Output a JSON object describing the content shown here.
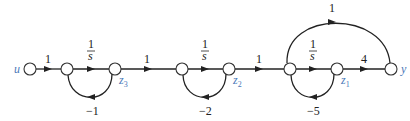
{
  "diagram": {
    "type": "signal-flow-graph",
    "nodes": [
      {
        "id": "u",
        "label": "u",
        "x": 30
      },
      {
        "id": "n1",
        "label": "",
        "x": 67
      },
      {
        "id": "z3",
        "label": "z",
        "sub": "3",
        "x": 115
      },
      {
        "id": "n2",
        "label": "",
        "x": 182
      },
      {
        "id": "z2",
        "label": "z",
        "sub": "2",
        "x": 229
      },
      {
        "id": "n3",
        "label": "",
        "x": 290
      },
      {
        "id": "z1",
        "label": "z",
        "sub": "1",
        "x": 337
      },
      {
        "id": "y",
        "label": "y",
        "x": 391
      }
    ],
    "edges": [
      {
        "from": "u",
        "to": "n1",
        "gain": "1"
      },
      {
        "from": "n1",
        "to": "z3",
        "gain_num": "1",
        "gain_den": "s"
      },
      {
        "from": "z3",
        "to": "n1",
        "gain": "−1",
        "feedback": true
      },
      {
        "from": "z3",
        "to": "n2",
        "gain": "1"
      },
      {
        "from": "n2",
        "to": "z2",
        "gain_num": "1",
        "gain_den": "s"
      },
      {
        "from": "z2",
        "to": "n2",
        "gain": "−2",
        "feedback": true
      },
      {
        "from": "z2",
        "to": "n3",
        "gain": "1"
      },
      {
        "from": "n3",
        "to": "z1",
        "gain_num": "1",
        "gain_den": "s"
      },
      {
        "from": "z1",
        "to": "n3",
        "gain": "−5",
        "feedback": true
      },
      {
        "from": "z1",
        "to": "y",
        "gain": "4"
      },
      {
        "from": "n3",
        "to": "y",
        "gain": "1",
        "feedforward": true
      }
    ]
  }
}
